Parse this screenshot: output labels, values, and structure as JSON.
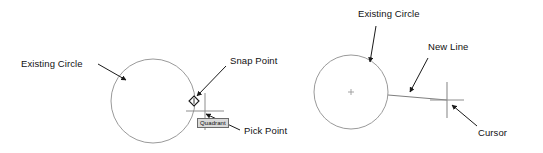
{
  "figure": {
    "background_color": "#ffffff",
    "line_color": "#8a8a8a",
    "annotation_color": "#111111",
    "tooltip_bg": "#d9d9d9",
    "tooltip_border": "#6b6b6b"
  },
  "panels": [
    {
      "id": "left",
      "name": "snap-point-panel",
      "labels": {
        "existing_circle": "Existing Circle",
        "snap_point": "Snap Point",
        "pick_point": "Pick Point"
      },
      "tooltip": "Quadrant",
      "circle": {
        "cx": 153,
        "cy": 101,
        "r": 42
      },
      "snap_marker": {
        "x": 194,
        "y": 101,
        "shape": "diamond"
      },
      "crosshair": {
        "x": 205,
        "y": 111
      }
    },
    {
      "id": "right",
      "name": "new-line-panel",
      "labels": {
        "existing_circle": "Existing Circle",
        "new_line": "New Line",
        "cursor": "Cursor"
      },
      "circle": {
        "cx": 351,
        "cy": 92,
        "r": 37
      },
      "center_mark": {
        "x": 351,
        "y": 92,
        "shape": "plus"
      },
      "new_line": {
        "x1": 388,
        "y1": 95,
        "x2": 447,
        "y2": 100
      },
      "cursor": {
        "x": 447,
        "y": 100,
        "shape": "crosshair"
      }
    }
  ]
}
